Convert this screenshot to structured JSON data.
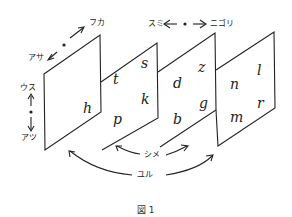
{
  "labels": {
    "fuka": "フカ",
    "asa": "アサ",
    "usu": "ウス",
    "atsu": "アツ",
    "sumi": "スミ",
    "nigori": "ニゴリ",
    "shime": "シメ",
    "yuru": "ユル"
  },
  "panels": [
    {
      "letters": [
        "h"
      ]
    },
    {
      "letters": [
        "t",
        "s",
        "p",
        "k"
      ]
    },
    {
      "letters": [
        "d",
        "z",
        "b",
        "g"
      ]
    },
    {
      "letters": [
        "n",
        "l",
        "m",
        "r"
      ]
    }
  ],
  "caption": "図 1"
}
